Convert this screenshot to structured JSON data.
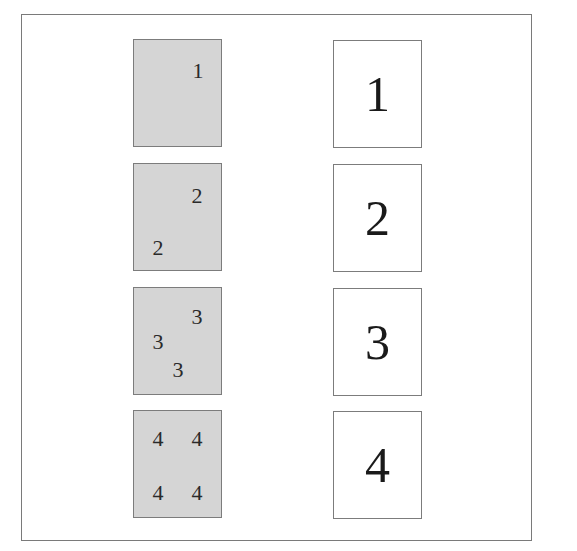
{
  "diagram": {
    "rows": [
      {
        "small": {
          "digits": [
            {
              "text": "1",
              "x": 64,
              "y": 31
            }
          ]
        },
        "large": {
          "text": "1"
        }
      },
      {
        "small": {
          "digits": [
            {
              "text": "2",
              "x": 63,
              "y": 32
            },
            {
              "text": "2",
              "x": 24,
              "y": 84
            }
          ]
        },
        "large": {
          "text": "2"
        }
      },
      {
        "small": {
          "digits": [
            {
              "text": "3",
              "x": 63,
              "y": 29
            },
            {
              "text": "3",
              "x": 24,
              "y": 54
            },
            {
              "text": "3",
              "x": 44,
              "y": 82
            }
          ]
        },
        "large": {
          "text": "3"
        }
      },
      {
        "small": {
          "digits": [
            {
              "text": "4",
              "x": 24,
              "y": 28
            },
            {
              "text": "4",
              "x": 63,
              "y": 28
            },
            {
              "text": "4",
              "x": 24,
              "y": 82
            },
            {
              "text": "4",
              "x": 63,
              "y": 82
            }
          ]
        },
        "large": {
          "text": "4"
        }
      }
    ],
    "colors": {
      "small_fill": "#d5d5d5",
      "large_fill": "#ffffff",
      "border": "#7c7c7c"
    }
  }
}
